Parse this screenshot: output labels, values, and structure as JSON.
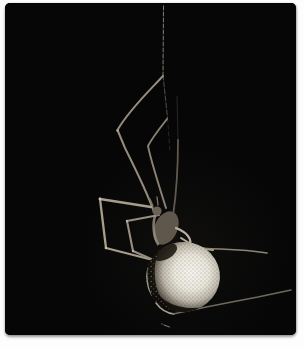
{
  "photo": {
    "alt": "A cobweb spider with long thin banded legs and a large round cream-white mottled abdomen hangs upside down from a single vertical silk thread against a pitch-black background, inside a white photo frame",
    "frame_color": "#fdfdfd",
    "photo_background": "#060606",
    "colors": {
      "silk_thread": "#b8b8b0",
      "legs_light": "#a79d8d",
      "legs_mid": "#8a8174",
      "cephalothorax": "#5f574c",
      "abdomen_highlight": "#f5f3ec",
      "abdomen_shadow": "#38342c",
      "abdomen_dark_markings": "#100e0a"
    }
  }
}
